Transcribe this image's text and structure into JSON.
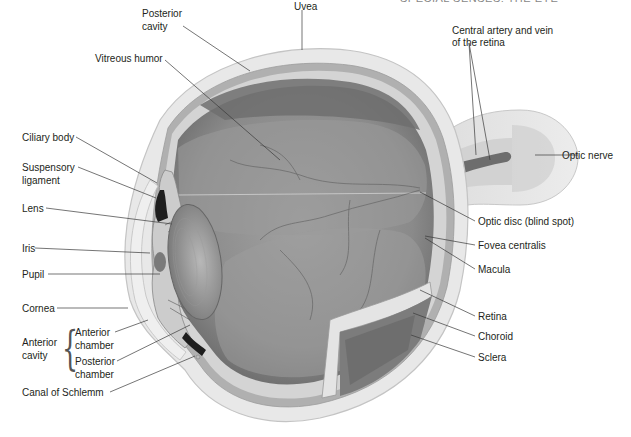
{
  "figure": {
    "header_fragment": "SPECIAL SENSES: THE EYE"
  },
  "labels": {
    "uvea": "Uvea",
    "posterior_cavity_1": "Posterior",
    "posterior_cavity_2": "cavity",
    "vitreous_humor": "Vitreous humor",
    "central_artery_1": "Central artery and vein",
    "central_artery_2": "of the retina",
    "ciliary_body": "Ciliary body",
    "suspensory_1": "Suspensory",
    "suspensory_2": "ligament",
    "lens": "Lens",
    "iris": "Iris",
    "pupil": "Pupil",
    "cornea": "Cornea",
    "anterior_cavity_1": "Anterior",
    "anterior_cavity_2": "cavity",
    "anterior_chamber_1": "Anterior",
    "anterior_chamber_2": "chamber",
    "posterior_chamber_1": "Posterior",
    "posterior_chamber_2": "chamber",
    "canal_of_schlemm": "Canal of Schlemm",
    "optic_nerve": "Optic nerve",
    "optic_disc": "Optic disc (blind spot)",
    "fovea_centralis": "Fovea centralis",
    "macula": "Macula",
    "retina": "Retina",
    "choroid": "Choroid",
    "sclera": "Sclera"
  },
  "colors": {
    "sclera": "#e6e6e6",
    "sclera_edge": "#c8c8c8",
    "uvea": "#a8a8a8",
    "vitreous": "#8f8f8f",
    "vitreous_dark": "#6e6e6e",
    "lens": "#b5b5b5",
    "leader_line": "#3a3a3a",
    "text": "#231f20"
  }
}
